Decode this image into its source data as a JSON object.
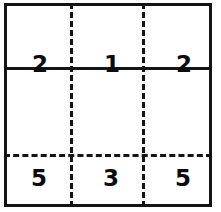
{
  "diagram": {
    "type": "partitioned-rectangle-grid",
    "background_color": "#ffffff",
    "line_color": "#141414",
    "text_color": "#0c0c0c",
    "columns": 3,
    "rows": 3,
    "rules": {
      "outer_border": "solid",
      "horizontal_upper": "solid",
      "horizontal_lower": "dashed",
      "vertical_left": "dashed",
      "vertical_right": "dashed"
    },
    "bands": [
      {
        "name": "top-band",
        "line_style": "solid",
        "digits": [
          "2",
          "1",
          "2"
        ]
      },
      {
        "name": "middle-band",
        "line_style": "none",
        "digits": [
          "",
          "",
          ""
        ]
      },
      {
        "name": "bottom-band",
        "line_style": "dashed",
        "digits": [
          "5",
          "3",
          "5"
        ]
      }
    ]
  }
}
